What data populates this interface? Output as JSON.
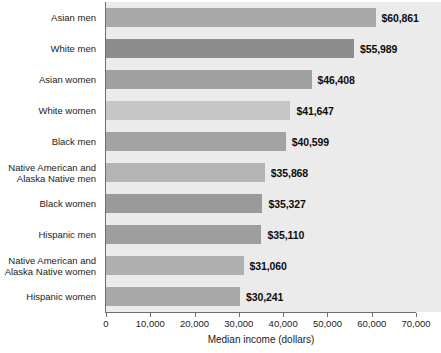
{
  "chart_data": {
    "type": "bar",
    "orientation": "horizontal",
    "title": "",
    "xlabel": "Median income (dollars)",
    "ylabel": "",
    "xlim": [
      0,
      70000
    ],
    "xticks": [
      0,
      10000,
      20000,
      30000,
      40000,
      50000,
      60000,
      70000
    ],
    "xtick_labels": [
      "0",
      "10,000",
      "20,000",
      "30,000",
      "40,000",
      "50,000",
      "60,000",
      "70,000"
    ],
    "grid": false,
    "legend": null,
    "categories": [
      "Asian men",
      "White men",
      "Asian women",
      "White women",
      "Black men",
      "Native American and Alaska Native men",
      "Black women",
      "Hispanic men",
      "Native American and Alaska Native women",
      "Hispanic women"
    ],
    "values": [
      60861,
      55989,
      46408,
      41647,
      40599,
      35868,
      35327,
      35110,
      31060,
      30241
    ],
    "data_labels": [
      "$60,861",
      "$55,989",
      "$46,408",
      "$41,647",
      "$40,599",
      "$35,868",
      "$35,327",
      "$35,110",
      "$31,060",
      "$30,241"
    ],
    "bar_colors": [
      "#a8a8a8",
      "#8d8d8d",
      "#a0a0a0",
      "#c6c6c6",
      "#a3a3a3",
      "#b4b4b4",
      "#9a9a9a",
      "#9e9e9e",
      "#b0b0b0",
      "#a8a8a8"
    ],
    "category_lines": [
      [
        "Asian men"
      ],
      [
        "White men"
      ],
      [
        "Asian women"
      ],
      [
        "White women"
      ],
      [
        "Black men"
      ],
      [
        "Native American and",
        "Alaska Native men"
      ],
      [
        "Black women"
      ],
      [
        "Hispanic men"
      ],
      [
        "Native American and",
        "Alaska Native women"
      ],
      [
        "Hispanic women"
      ]
    ]
  },
  "colors": {
    "plot_background": "#ebebeb",
    "page_background": "#ffffff",
    "axis": "#6e6e6e",
    "text": "#1b1b1b",
    "label_text": "#0d0d0d"
  }
}
